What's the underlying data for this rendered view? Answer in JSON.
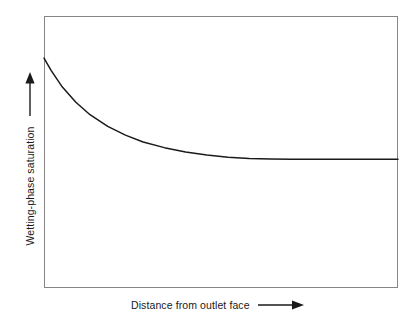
{
  "figure": {
    "background_color": "#ffffff",
    "frame_color": "#868686",
    "curve_color": "#1a1a1a"
  },
  "axes": {
    "y": {
      "label": "Wetting-phase saturation",
      "arrow_direction": "up",
      "arrow_icon": "arrow-up-icon",
      "ticks": [],
      "tick_labels": []
    },
    "x": {
      "label": "Distance from outlet face",
      "arrow_direction": "right",
      "arrow_icon": "arrow-right-icon",
      "ticks": [],
      "tick_labels": []
    }
  },
  "chart_data": {
    "type": "line",
    "title": "",
    "subtitle": "",
    "xlabel": "Distance from outlet face",
    "ylabel": "Wetting-phase saturation",
    "xlim": [
      0,
      1
    ],
    "ylim": [
      0,
      1
    ],
    "grid": false,
    "legend": null,
    "legend_position": "none",
    "axis_ticks_shown": false,
    "axis_numeric_labels_shown": false,
    "series": [
      {
        "name": "Wetting-phase saturation profile",
        "color": "#1a1a1a",
        "line_width": 1.5,
        "x": [
          0.0,
          0.02,
          0.05,
          0.09,
          0.13,
          0.18,
          0.23,
          0.28,
          0.34,
          0.4,
          0.46,
          0.52,
          0.58,
          0.64,
          0.7,
          0.76,
          0.82,
          0.88,
          0.94,
          1.0
        ],
        "y": [
          0.845,
          0.8,
          0.742,
          0.683,
          0.637,
          0.594,
          0.562,
          0.537,
          0.516,
          0.5,
          0.489,
          0.481,
          0.476,
          0.474,
          0.473,
          0.473,
          0.473,
          0.473,
          0.473,
          0.473
        ]
      }
    ],
    "annotations": [
      {
        "name": "plateau-onset",
        "text": "",
        "x": 0.48,
        "y": 0.473
      }
    ]
  }
}
